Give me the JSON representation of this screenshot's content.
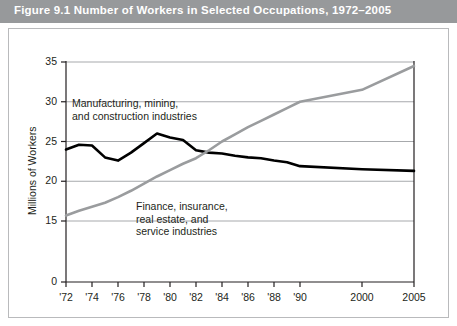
{
  "figure": {
    "title": "Figure 9.1  Number of Workers in Selected Occupations, 1972–2005",
    "banner_color": "#97999b",
    "banner_text_color": "#ffffff",
    "frame_color": "#b9babc"
  },
  "chart_data": {
    "type": "line",
    "title": "Number of Workers in Selected Occupations, 1972–2005",
    "xlabel": "",
    "ylabel": "Millions of Workers",
    "grid": true,
    "legend_position": "inline-annotation",
    "xlim": [
      1972,
      2005
    ],
    "ylim": [
      15,
      35
    ],
    "y_axis_has_break": true,
    "y_zero_label": "0",
    "ytick_labels": [
      "0",
      "15",
      "20",
      "25",
      "30",
      "35"
    ],
    "ytick_values": [
      0,
      15,
      20,
      25,
      30,
      35
    ],
    "xtick_labels": [
      "'72",
      "'74",
      "'76",
      "'78",
      "'80",
      "'82",
      "'84",
      "'86",
      "'88",
      "'90",
      "2000",
      "2005"
    ],
    "xtick_values": [
      1972,
      1974,
      1976,
      1978,
      1980,
      1982,
      1984,
      1986,
      1988,
      1990,
      2000,
      2005
    ],
    "series": [
      {
        "name": "Manufacturing, mining, and construction industries",
        "label_lines": [
          "Manufacturing, mining,",
          "and construction industries"
        ],
        "color": "#000000",
        "width": 2.6,
        "x": [
          1972,
          1973,
          1974,
          1975,
          1976,
          1977,
          1978,
          1979,
          1980,
          1981,
          1982,
          1983,
          1984,
          1985,
          1986,
          1987,
          1988,
          1989,
          1990,
          2000,
          2005
        ],
        "values": [
          24.0,
          24.6,
          24.5,
          23.0,
          22.6,
          23.6,
          24.8,
          26.0,
          25.5,
          25.2,
          23.9,
          23.6,
          23.5,
          23.2,
          23.0,
          22.9,
          22.6,
          22.4,
          21.9,
          21.5,
          21.3
        ]
      },
      {
        "name": "Finance, insurance, real estate, and service industries",
        "label_lines": [
          "Finance, insurance,",
          "real estate, and",
          "service industries"
        ],
        "color": "#9a9c9e",
        "width": 2.6,
        "x": [
          1972,
          1973,
          1974,
          1975,
          1976,
          1977,
          1978,
          1979,
          1980,
          1981,
          1982,
          1983,
          1984,
          1985,
          1986,
          1987,
          1988,
          1989,
          1990,
          2000,
          2005
        ],
        "values": [
          15.7,
          16.3,
          16.8,
          17.3,
          18.0,
          18.8,
          19.7,
          20.6,
          21.4,
          22.2,
          22.9,
          23.9,
          25.0,
          25.9,
          26.8,
          27.6,
          28.4,
          29.2,
          30.0,
          31.5,
          34.5
        ]
      }
    ],
    "annotations": [
      {
        "id": "manufacturing-label",
        "text": "Manufacturing, mining, and construction industries"
      },
      {
        "id": "finance-label",
        "text": "Finance, insurance, real estate, and service industries"
      }
    ]
  }
}
